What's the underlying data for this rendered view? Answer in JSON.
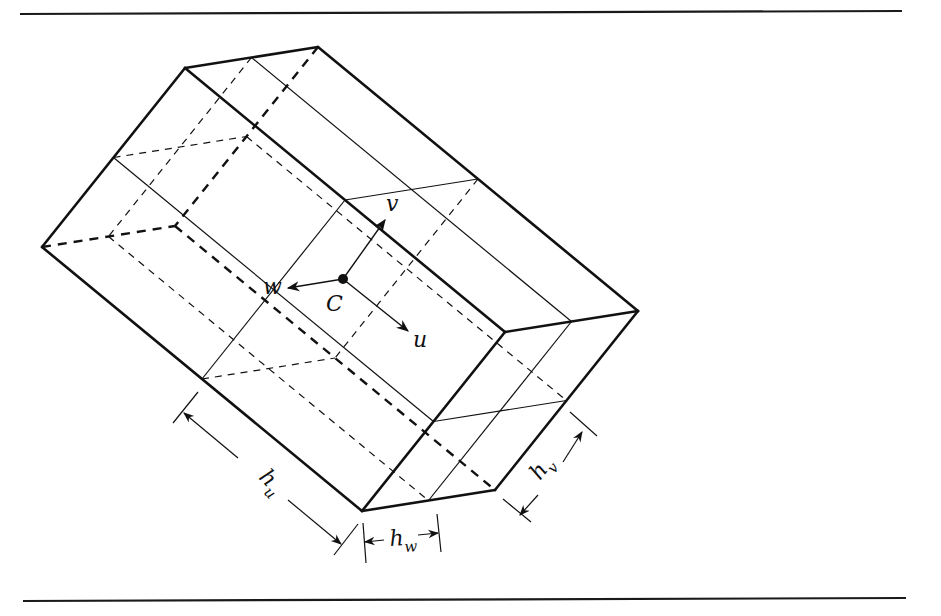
{
  "figure": {
    "center_label": "C",
    "axes": [
      {
        "name": "u",
        "label": "u"
      },
      {
        "name": "v",
        "label": "v"
      },
      {
        "name": "w",
        "label": "w"
      }
    ],
    "dimensions": [
      {
        "name": "h_u",
        "base": "h",
        "subscript": "u"
      },
      {
        "name": "h_v",
        "base": "h",
        "subscript": "v"
      },
      {
        "name": "h_w",
        "base": "h",
        "subscript": "w"
      }
    ],
    "colors": {
      "ink": "#111111",
      "background": "#ffffff"
    }
  }
}
